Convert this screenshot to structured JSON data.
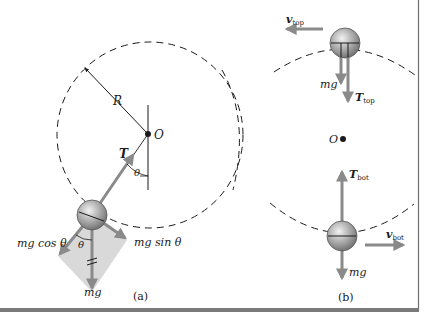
{
  "figure": {
    "panel_a": {
      "caption": "(a)",
      "labels": {
        "radius": "R",
        "pivot": "O",
        "tension": "T",
        "angle_top": "θ",
        "angle_bottom": "θ",
        "mg_cos": "mg cos θ",
        "mg_sin": "mg sin θ",
        "mg": "mg"
      }
    },
    "panel_b": {
      "caption": "(b)",
      "labels": {
        "v_top_main": "v",
        "v_top_sub": "top",
        "mg_top": "mg",
        "t_top_main": "T",
        "t_top_sub": "top",
        "center": "O",
        "t_bot_main": "T",
        "t_bot_sub": "bot",
        "v_bot_main": "v",
        "v_bot_sub": "bot",
        "mg_bot": "mg"
      }
    },
    "colors": {
      "arrow": "#8a8a8a",
      "shade": "#d9d9d9",
      "line": "#1a1a1a",
      "border": "#6e6e6e"
    }
  }
}
